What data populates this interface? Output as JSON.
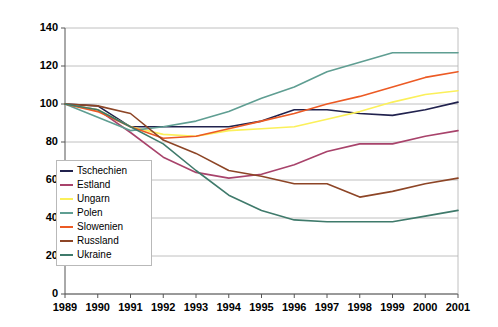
{
  "chart_data": {
    "type": "line",
    "title": "",
    "subtitle": "",
    "xlabel": "",
    "ylabel": "",
    "categories": [
      "1989",
      "1990",
      "1991",
      "1992",
      "1993",
      "1994",
      "1995",
      "1996",
      "1997",
      "1998",
      "1999",
      "2000",
      "2001"
    ],
    "x": [
      1989,
      1990,
      1991,
      1992,
      1993,
      1994,
      1995,
      1996,
      1997,
      1998,
      1999,
      2000,
      2001
    ],
    "xlim": [
      1989,
      2001
    ],
    "ylim": [
      0,
      140
    ],
    "yticks": [
      0,
      20,
      40,
      60,
      80,
      100,
      120,
      140
    ],
    "grid": "horizontal",
    "legend_position": "inner-left-lower",
    "series": [
      {
        "name": "Tschechien",
        "color": "#21224e",
        "values": [
          100,
          99,
          88,
          88,
          88,
          88,
          91,
          97,
          97,
          95,
          94,
          97,
          101
        ]
      },
      {
        "name": "Estland",
        "color": "#a8436b",
        "values": [
          100,
          97,
          85,
          72,
          64,
          61,
          63,
          68,
          75,
          79,
          79,
          83,
          86
        ]
      },
      {
        "name": "Ungarn",
        "color": "#fbf05a",
        "values": [
          100,
          97,
          88,
          84,
          83,
          86,
          87,
          88,
          92,
          96,
          101,
          105,
          107
        ]
      },
      {
        "name": "Polen",
        "color": "#5f9e92",
        "values": [
          100,
          93,
          86,
          88,
          91,
          96,
          103,
          109,
          117,
          122,
          127,
          127,
          127
        ]
      },
      {
        "name": "Slowenien",
        "color": "#ec5a24",
        "values": [
          100,
          96,
          88,
          82,
          83,
          87,
          91,
          95,
          100,
          104,
          109,
          114,
          117
        ]
      },
      {
        "name": "Russland",
        "color": "#8d4526",
        "values": [
          100,
          99,
          95,
          81,
          74,
          65,
          62,
          58,
          58,
          51,
          54,
          58,
          61
        ]
      },
      {
        "name": "Ukraine",
        "color": "#3f7a6b",
        "values": [
          100,
          97,
          88,
          79,
          65,
          52,
          44,
          39,
          38,
          38,
          38,
          41,
          44
        ]
      }
    ]
  },
  "legend": {
    "items": [
      {
        "label": "Tschechien"
      },
      {
        "label": "Estland"
      },
      {
        "label": "Ungarn"
      },
      {
        "label": "Polen"
      },
      {
        "label": "Slowenien"
      },
      {
        "label": "Russland"
      },
      {
        "label": "Ukraine"
      }
    ]
  }
}
